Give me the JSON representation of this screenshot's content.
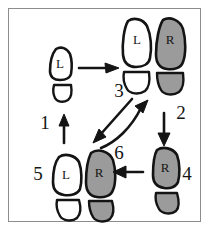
{
  "diagram": {
    "frame": {
      "border_color": "#8d8d8d",
      "background": "#ffffff"
    },
    "colors": {
      "ink": "#141414",
      "left_foot_fill": "#ffffff",
      "right_foot_fill": "#9b9b9b",
      "frame_border": "#8d8d8d",
      "page_background": "#ffffff"
    },
    "legend": {
      "left_letter": "L",
      "right_letter": "R"
    },
    "footprints": [
      {
        "id": "fp-1-left",
        "letter": "L",
        "side": "left",
        "fill": "white",
        "group": "position-1"
      },
      {
        "id": "fp-2-left",
        "letter": "L",
        "side": "left",
        "fill": "white",
        "group": "position-2-3"
      },
      {
        "id": "fp-2-right",
        "letter": "R",
        "side": "right",
        "fill": "gray",
        "group": "position-2-3"
      },
      {
        "id": "fp-4-right",
        "letter": "R",
        "side": "right",
        "fill": "gray",
        "group": "position-4"
      },
      {
        "id": "fp-5-left",
        "letter": "L",
        "side": "left",
        "fill": "white",
        "group": "position-5-6"
      },
      {
        "id": "fp-5-right",
        "letter": "R",
        "side": "right",
        "fill": "gray",
        "group": "position-5-6"
      }
    ],
    "step_labels": [
      {
        "id": "step-1",
        "text": "1"
      },
      {
        "id": "step-2",
        "text": "2"
      },
      {
        "id": "step-3",
        "text": "3"
      },
      {
        "id": "step-4",
        "text": "4"
      },
      {
        "id": "step-5",
        "text": "5"
      },
      {
        "id": "step-6",
        "text": "6"
      }
    ],
    "arrows": [
      {
        "id": "arrow-1-up",
        "label": "1",
        "direction": "up",
        "description": "upward arrow beside label 1"
      },
      {
        "id": "arrow-right",
        "label": "",
        "direction": "right",
        "description": "horizontal arrow from position 1 to position 2"
      },
      {
        "id": "arrow-2-down",
        "label": "2",
        "direction": "down",
        "description": "downward arrow from position 2 to position 4"
      },
      {
        "id": "arrow-3-downleft",
        "label": "3",
        "direction": "down-left",
        "description": "diagonal arrow down-left toward position 5"
      },
      {
        "id": "arrow-6-upright",
        "label": "6",
        "direction": "up-right",
        "description": "curved arrow up-right back toward position 2"
      },
      {
        "id": "arrow-6-left",
        "label": "6",
        "direction": "left",
        "description": "horizontal arrow pointing left from position 4"
      }
    ]
  }
}
